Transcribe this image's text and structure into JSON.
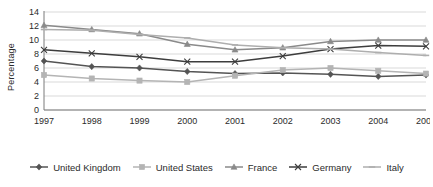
{
  "chart_data": {
    "type": "line",
    "title": "",
    "subtitle": "",
    "xlabel": "",
    "ylabel": "Percentage",
    "x": [
      "1997",
      "1998",
      "1999",
      "2000",
      "2001",
      "2002",
      "2003",
      "2004",
      "2005"
    ],
    "categories": [
      "1997",
      "1998",
      "1999",
      "2000",
      "2001",
      "2002",
      "2003",
      "2004",
      "2005"
    ],
    "ylim": [
      0,
      14
    ],
    "ytick_values": [
      0,
      2,
      4,
      6,
      8,
      10,
      12,
      14
    ],
    "ytick_labels": [
      "0",
      "2",
      "4",
      "6",
      "8",
      "10",
      "12",
      "14"
    ],
    "grid": true,
    "grid_axis": "y",
    "legend_position": "bottom",
    "series": [
      {
        "name": "United Kingdom",
        "color": "#545454",
        "marker": "diamond",
        "values": [
          7.0,
          6.2,
          6.0,
          5.5,
          5.2,
          5.3,
          5.1,
          4.8,
          5.0
        ]
      },
      {
        "name": "United States",
        "color": "#b4b4b4",
        "marker": "square",
        "values": [
          5.0,
          4.5,
          4.2,
          4.0,
          4.9,
          5.7,
          6.0,
          5.6,
          5.2
        ]
      },
      {
        "name": "France",
        "color": "#8a8a8a",
        "marker": "triangle",
        "values": [
          12.1,
          11.5,
          10.9,
          9.4,
          8.6,
          8.9,
          9.8,
          10.0,
          10.0
        ]
      },
      {
        "name": "Germany",
        "color": "#3d3d3d",
        "marker": "cross",
        "values": [
          8.6,
          8.1,
          7.6,
          6.9,
          6.9,
          7.7,
          8.7,
          9.2,
          9.1
        ]
      },
      {
        "name": "Italy",
        "color": "#aeaeae",
        "marker": "dash",
        "values": [
          11.5,
          11.4,
          10.8,
          10.3,
          9.3,
          8.9,
          8.7,
          8.2,
          7.8
        ]
      }
    ]
  },
  "axis": {
    "y_title": "Percentage"
  },
  "legend": {
    "items": [
      {
        "label": "United Kingdom"
      },
      {
        "label": "United States"
      },
      {
        "label": "France"
      },
      {
        "label": "Germany"
      },
      {
        "label": "Italy"
      }
    ]
  }
}
